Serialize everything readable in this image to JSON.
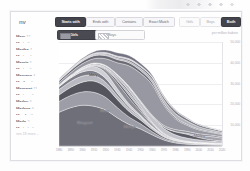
{
  "app": {
    "brand": "nv"
  },
  "sidebar": {
    "names": [
      {
        "name": "Mary",
        "count": "12"
      },
      {
        "name": "Marie",
        "count": "9"
      },
      {
        "name": "Martha",
        "count": "7"
      },
      {
        "name": "Marion",
        "count": "6"
      },
      {
        "name": "Margie",
        "count": "5"
      },
      {
        "name": "Marina",
        "count": "5"
      },
      {
        "name": "Maryann",
        "count": "4"
      },
      {
        "name": "Marilyn",
        "count": "4"
      },
      {
        "name": "Margaret",
        "count": "11"
      },
      {
        "name": "Marissa",
        "count": "3"
      },
      {
        "name": "Marley",
        "count": "3"
      },
      {
        "name": "Marlene",
        "count": "6"
      },
      {
        "name": "Marsha",
        "count": "3"
      },
      {
        "name": "Marla",
        "count": "2"
      },
      {
        "name": "Marjorie",
        "count": "5"
      }
    ],
    "more_label": "see 18 more…"
  },
  "toolbar": {
    "match_modes": [
      {
        "label": "Starts with",
        "active": true
      },
      {
        "label": "Ends with",
        "active": false
      },
      {
        "label": "Contains",
        "active": false
      },
      {
        "label": "Exact Match",
        "active": false
      }
    ],
    "gender_modes": [
      {
        "label": "Girls",
        "active": false
      },
      {
        "label": "Boys",
        "active": false
      },
      {
        "label": "Both",
        "active": true
      }
    ]
  },
  "legend": {
    "girls_label": "Girls",
    "boys_label": "Boys",
    "axis_note": "per million babies"
  },
  "chart_data": {
    "type": "area",
    "title": "",
    "xlabel": "",
    "ylabel": "per million babies",
    "ylim": [
      0,
      50000
    ],
    "yticks": [
      "50,000",
      "40,000",
      "30,000",
      "20,000",
      "10,000"
    ],
    "grid": true,
    "legend_position": "top-left",
    "x": [
      "1880",
      "1890",
      "1900",
      "1910",
      "1920",
      "1930",
      "1940",
      "1950",
      "1960",
      "1970",
      "1980",
      "1990",
      "2000",
      "2010",
      "2020"
    ],
    "annotations": [
      {
        "text": "Mary",
        "x": "1910",
        "y": 34000
      },
      {
        "text": "Margaret",
        "x": "1900",
        "y": 11000
      },
      {
        "text": "Marie",
        "x": "1920",
        "y": 17000
      },
      {
        "text": "Marilyn",
        "x": "1940",
        "y": 9000
      },
      {
        "text": "Marley",
        "x": "2000",
        "y": 5000
      }
    ],
    "series": [
      {
        "name": "Mary",
        "values": [
          16200,
          18400,
          19600,
          19100,
          17300,
          13600,
          10400,
          8200,
          5400,
          2900,
          1500,
          900,
          620,
          430,
          360
        ]
      },
      {
        "name": "Margaret",
        "values": [
          5200,
          5900,
          6400,
          6700,
          6100,
          4900,
          3600,
          2500,
          1500,
          820,
          520,
          380,
          300,
          260,
          240
        ]
      },
      {
        "name": "Marie",
        "values": [
          3100,
          3900,
          4700,
          5400,
          5000,
          3900,
          2700,
          1800,
          1100,
          640,
          420,
          300,
          240,
          210,
          190
        ]
      },
      {
        "name": "Martha",
        "values": [
          2600,
          2800,
          2900,
          2700,
          2300,
          1800,
          1400,
          1100,
          760,
          470,
          330,
          260,
          220,
          200,
          190
        ]
      },
      {
        "name": "Marion",
        "values": [
          1400,
          1700,
          2000,
          2200,
          1900,
          1300,
          850,
          520,
          300,
          180,
          120,
          95,
          80,
          75,
          70
        ]
      },
      {
        "name": "Marjorie",
        "values": [
          260,
          520,
          1250,
          2100,
          2600,
          2200,
          1400,
          760,
          380,
          190,
          110,
          80,
          65,
          60,
          58
        ]
      },
      {
        "name": "Marilyn",
        "values": [
          60,
          90,
          160,
          420,
          1350,
          2600,
          2900,
          1800,
          900,
          380,
          180,
          110,
          85,
          78,
          72
        ]
      },
      {
        "name": "Marlene",
        "values": [
          30,
          45,
          70,
          140,
          420,
          1100,
          1300,
          820,
          420,
          190,
          105,
          72,
          58,
          54,
          52
        ]
      },
      {
        "name": "Marsha",
        "values": [
          25,
          35,
          55,
          95,
          240,
          700,
          1050,
          760,
          360,
          160,
          90,
          62,
          50,
          47,
          45
        ]
      },
      {
        "name": "Marcia",
        "values": [
          40,
          55,
          80,
          150,
          330,
          760,
          980,
          690,
          330,
          150,
          85,
          60,
          48,
          45,
          43
        ]
      },
      {
        "name": "Maria",
        "values": [
          420,
          520,
          640,
          820,
          1100,
          1400,
          1900,
          2300,
          2600,
          2400,
          1900,
          1500,
          1200,
          980,
          860
        ]
      },
      {
        "name": "Marissa",
        "values": [
          8,
          10,
          14,
          20,
          30,
          48,
          75,
          130,
          260,
          620,
          1450,
          1850,
          1100,
          520,
          300
        ]
      },
      {
        "name": "Marley",
        "values": [
          5,
          6,
          8,
          10,
          14,
          20,
          28,
          40,
          65,
          110,
          210,
          420,
          980,
          1600,
          1350
        ]
      },
      {
        "name": "Marina",
        "values": [
          18,
          24,
          34,
          50,
          80,
          130,
          210,
          340,
          520,
          720,
          880,
          960,
          880,
          760,
          680
        ]
      },
      {
        "name": "Mark",
        "values": [
          1100,
          1300,
          1600,
          2100,
          3200,
          5600,
          9800,
          13200,
          14600,
          9800,
          5200,
          2900,
          1800,
          1250,
          1020
        ]
      },
      {
        "name": "Martin",
        "values": [
          900,
          1050,
          1200,
          1400,
          1500,
          1500,
          1450,
          1350,
          1150,
          880,
          640,
          500,
          420,
          380,
          350
        ]
      },
      {
        "name": "Marcus",
        "values": [
          280,
          330,
          400,
          480,
          560,
          640,
          760,
          940,
          1250,
          1650,
          1850,
          1550,
          1150,
          880,
          740
        ]
      },
      {
        "name": "Mario",
        "values": [
          120,
          160,
          220,
          300,
          420,
          560,
          720,
          900,
          1100,
          1250,
          1300,
          1150,
          920,
          760,
          660
        ]
      },
      {
        "name": "Marshall",
        "values": [
          300,
          340,
          400,
          460,
          520,
          540,
          520,
          470,
          380,
          280,
          210,
          170,
          150,
          140,
          135
        ]
      },
      {
        "name": "Marvin",
        "values": [
          180,
          260,
          420,
          720,
          1150,
          1500,
          1450,
          1150,
          760,
          470,
          300,
          220,
          180,
          160,
          150
        ]
      }
    ]
  }
}
